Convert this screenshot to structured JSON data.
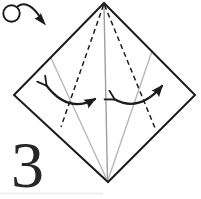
{
  "step": {
    "number": "3"
  },
  "colors": {
    "line": "#1c1c1c",
    "crease_center": "#9e9e9e",
    "crease_side": "#b8b8b8",
    "background": "#ffffff"
  },
  "diagram": {
    "type": "origami-instruction-step",
    "canvas": {
      "width": 201,
      "height": 199
    },
    "paper": {
      "name": "paper-outline",
      "outline": [
        [
          104,
          3
        ],
        [
          195,
          95
        ],
        [
          108,
          182
        ],
        [
          14,
          95
        ]
      ]
    },
    "creases": [
      {
        "name": "center-crease",
        "from": [
          104,
          5
        ],
        "to": [
          107.5,
          180
        ],
        "stroke": "#9e9e9e"
      },
      {
        "name": "left-side-crease",
        "from": [
          51,
          58
        ],
        "to": [
          107,
          180
        ],
        "stroke": "#b8b8b8"
      },
      {
        "name": "right-side-crease",
        "from": [
          152,
          51
        ],
        "to": [
          108,
          180
        ],
        "stroke": "#b8b8b8"
      }
    ],
    "folds": [
      {
        "name": "left-valley-fold-line",
        "from": [
          103.5,
          5
        ],
        "to": [
          61,
          127
        ]
      },
      {
        "name": "right-valley-fold-line",
        "from": [
          104.5,
          5
        ],
        "to": [
          155,
          128
        ]
      }
    ],
    "arrows": [
      {
        "name": "left-fold-unfold-arrow",
        "path": "M 46 85 Q 68 114 95 99"
      },
      {
        "name": "right-fold-unfold-arrow",
        "path": "M 114 99 Q 139 113 162 86"
      }
    ],
    "turn_over_symbol": {
      "name": "turn-over-icon",
      "circle": {
        "cx": 11.5,
        "cy": 13.5,
        "r": 8.2
      },
      "tail": "M 17.5 6.5 C 26 0.5 34 8 40 17",
      "head": "M 46 25.5 L 34.5 18.5 Q 39.5 16.5 40.8 13 Z"
    },
    "artifacts": [
      {
        "name": "page-scan-artifact",
        "from": [
          0,
          193.5
        ],
        "to": [
          103,
          193.5
        ]
      }
    ]
  }
}
